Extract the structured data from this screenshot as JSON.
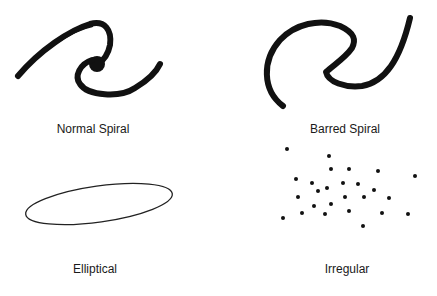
{
  "diagram": {
    "type": "galaxy-classification",
    "panels": [
      {
        "id": "normal-spiral",
        "label": "Normal Spiral",
        "shape": "spiral with central bulge"
      },
      {
        "id": "barred-spiral",
        "label": "Barred Spiral",
        "shape": "S-shaped spiral with bar"
      },
      {
        "id": "elliptical",
        "label": "Elliptical",
        "shape": "tilted ellipse outline"
      },
      {
        "id": "irregular",
        "label": "Irregular",
        "shape": "scattered dots"
      }
    ],
    "colors": {
      "ink": "#111111",
      "background": "#ffffff"
    }
  }
}
